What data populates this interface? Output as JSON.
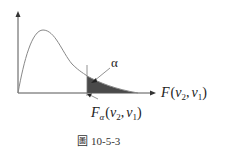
{
  "figure": {
    "type": "F-distribution density curve with shaded right tail",
    "alpha_label": "α",
    "x_axis_label": {
      "main": "F",
      "open": "(",
      "v2": "v",
      "v2_sub": "2",
      "comma": ",",
      "v1": "v",
      "v1_sub": "1",
      "close": ")"
    },
    "critical_label": {
      "main": "F",
      "sub": "α",
      "open": "(",
      "v2": "v",
      "v2_sub": "2",
      "comma": ",",
      "v1": "v",
      "v1_sub": "1",
      "close": ")"
    },
    "caption": {
      "icon": "圖",
      "text": "10-5-3"
    },
    "colors": {
      "axis": "#555555",
      "curve": "#888888",
      "shade": "#555555"
    }
  }
}
